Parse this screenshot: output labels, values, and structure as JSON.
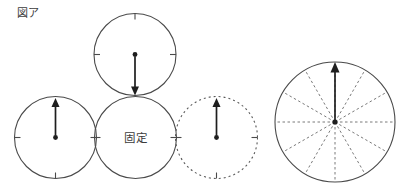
{
  "figure": {
    "label": "図ア"
  },
  "diagram": {
    "fixed_circle_label": "固定",
    "circles": [
      {
        "name": "top-circle",
        "outline": "solid",
        "arrow": "down-from-center-dot",
        "tick_positions": [
          "12",
          "3",
          "9"
        ]
      },
      {
        "name": "left-circle",
        "outline": "solid",
        "arrow": "up-from-center-dot",
        "tick_positions": [
          "3",
          "6",
          "9"
        ]
      },
      {
        "name": "fixed-circle",
        "outline": "solid",
        "arrow": "none",
        "label": "固定",
        "tick_positions": [
          "3",
          "9"
        ]
      },
      {
        "name": "dotted-circle",
        "outline": "dotted",
        "arrow": "up-from-center-dot",
        "tick_positions": [
          "3",
          "6",
          "9"
        ]
      },
      {
        "name": "spoked-circle",
        "outline": "solid",
        "arrow": "up-from-center-dot",
        "spoke_count": 12,
        "spoke_style": "dashed"
      }
    ]
  },
  "colors": {
    "background": "#ffffff",
    "circle_stroke": "#4a4a4a",
    "dotted_stroke": "#5a5a5a",
    "spoke_stroke": "#7a7a7a",
    "arrow_color": "#1e1e1e",
    "text_color": "#3c3c3c"
  }
}
